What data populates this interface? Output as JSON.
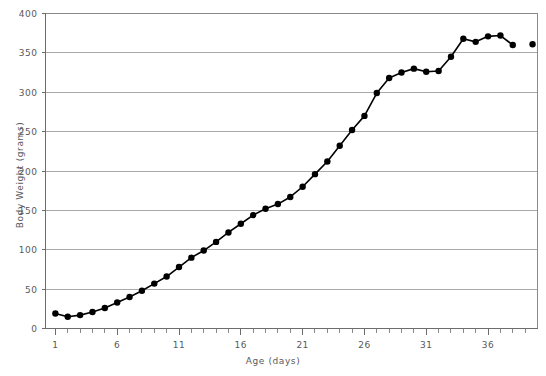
{
  "chart_data": {
    "type": "line",
    "title": "",
    "xlabel": "Age  (days)",
    "ylabel": "Body Weight  (grams)",
    "xlim": [
      0.2,
      40
    ],
    "ylim": [
      0,
      400
    ],
    "xticks": [
      1,
      6,
      11,
      16,
      21,
      26,
      31,
      36
    ],
    "xtick_labels": [
      "1",
      "6",
      "11",
      "16",
      "21",
      "26",
      "31",
      "36"
    ],
    "yticks": [
      0,
      50,
      100,
      150,
      200,
      250,
      300,
      350,
      400
    ],
    "ytick_labels": [
      "0",
      "50",
      "100",
      "150",
      "200",
      "250",
      "300",
      "350",
      "400"
    ],
    "grid": "horizontal",
    "legend": "none",
    "marker": "filled-circle",
    "line_color": "#000000",
    "marker_color": "#000000",
    "grid_color": "#a9a9a9",
    "text_color": "#59595b",
    "series": [
      {
        "name": "Body weight",
        "x": [
          1,
          2,
          3,
          4,
          5,
          6,
          7,
          8,
          9,
          10,
          11,
          12,
          13,
          14,
          15,
          16,
          17,
          18,
          19,
          20,
          21,
          22,
          23,
          24,
          25,
          26,
          27,
          28,
          29,
          30,
          31,
          32,
          33,
          34,
          35,
          36,
          37,
          38
        ],
        "values": [
          19,
          15,
          17,
          21,
          26,
          33,
          40,
          48,
          57,
          66,
          78,
          90,
          99,
          110,
          122,
          133,
          144,
          152,
          158,
          167,
          180,
          196,
          212,
          232,
          252,
          270,
          299,
          318,
          325,
          330,
          326,
          327,
          345,
          368,
          364,
          371,
          372,
          360
        ],
        "connected": true
      },
      {
        "name": "Body weight (final point, unconnected)",
        "x": [
          39.6
        ],
        "values": [
          361
        ],
        "connected": false
      }
    ]
  }
}
